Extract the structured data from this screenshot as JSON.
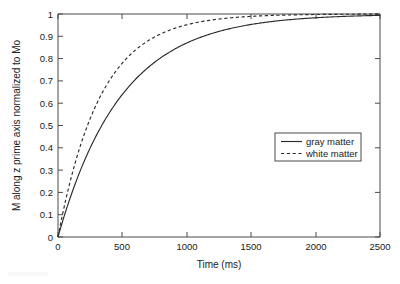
{
  "chart_data": {
    "type": "line",
    "title": "",
    "xlabel": "Time (ms)",
    "ylabel": "M along z prime axis normalized to Mo",
    "xlim": [
      0,
      2500
    ],
    "ylim": [
      0,
      1
    ],
    "grid": false,
    "legend_position": "center-right",
    "xticks": [
      0,
      500,
      1000,
      1500,
      2000,
      2500
    ],
    "xticklabels": [
      "0",
      "500",
      "1000",
      "1500",
      "2000",
      "2500"
    ],
    "yticks": [
      0,
      0.1,
      0.2,
      0.3,
      0.4,
      0.5,
      0.6,
      0.7,
      0.8,
      0.9,
      1
    ],
    "yticklabels": [
      "0",
      "0.1",
      "0.2",
      "0.3",
      "0.4",
      "0.5",
      "0.6",
      "0.7",
      "0.8",
      "0.9",
      "1"
    ],
    "x": [
      0,
      50,
      100,
      150,
      200,
      250,
      300,
      350,
      400,
      450,
      500,
      600,
      700,
      800,
      900,
      1000,
      1100,
      1200,
      1300,
      1400,
      1500,
      1700,
      1900,
      2100,
      2300,
      2500
    ],
    "series": [
      {
        "name": "gray matter",
        "style": "solid",
        "color": "#2b2b2b",
        "t1_ms": 490,
        "values": [
          0,
          0.097,
          0.185,
          0.264,
          0.336,
          0.401,
          0.459,
          0.512,
          0.56,
          0.602,
          0.641,
          0.709,
          0.764,
          0.808,
          0.844,
          0.873,
          0.897,
          0.916,
          0.932,
          0.945,
          0.955,
          0.969,
          0.979,
          0.986,
          0.991,
          0.994
        ]
      },
      {
        "name": "white matter",
        "style": "dashed",
        "color": "#2b2b2b",
        "t1_ms": 330,
        "values": [
          0,
          0.14,
          0.261,
          0.365,
          0.455,
          0.532,
          0.598,
          0.655,
          0.703,
          0.745,
          0.781,
          0.838,
          0.88,
          0.911,
          0.935,
          0.952,
          0.965,
          0.974,
          0.981,
          0.986,
          0.99,
          0.995,
          0.997,
          0.998,
          0.999,
          0.999
        ]
      }
    ],
    "annotations": []
  },
  "legend": {
    "entries": [
      {
        "label": "gray matter",
        "style": "solid"
      },
      {
        "label": "white matter",
        "style": "dashed"
      }
    ]
  },
  "axes": {
    "x_title": "Time (ms)",
    "y_title": "M along z prime axis normalized to Mo"
  }
}
